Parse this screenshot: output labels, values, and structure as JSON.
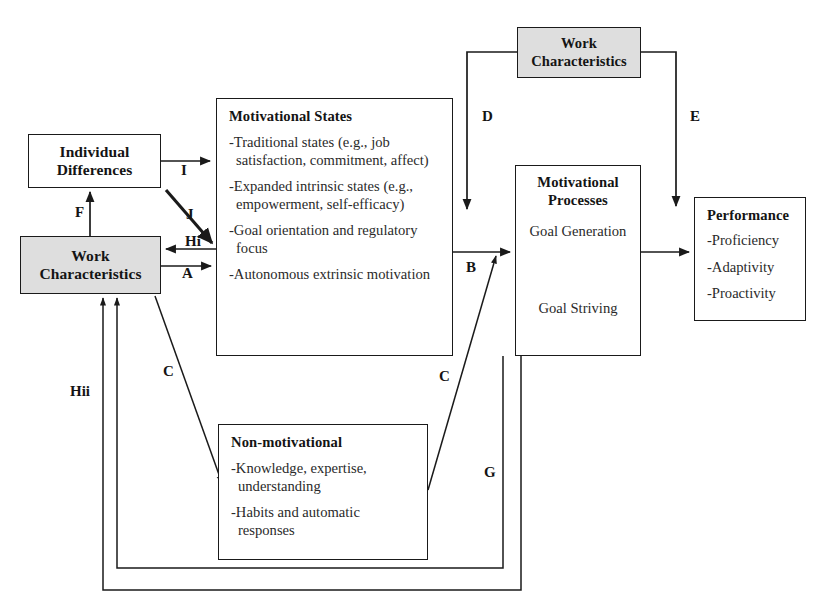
{
  "diagram": {
    "nodes": {
      "individual_differences": {
        "title": "Individual\nDifferences"
      },
      "work_characteristics_left": {
        "title": "Work\nCharacteristics"
      },
      "work_characteristics_top": {
        "title": "Work\nCharacteristics"
      },
      "motivational_states": {
        "title": "Motivational States",
        "items": [
          "-Traditional states (e.g., job satisfaction, commitment, affect)",
          "-Expanded intrinsic states (e.g., empowerment, self-efficacy)",
          "-Goal orientation and regulatory focus",
          "-Autonomous extrinsic motivation"
        ]
      },
      "motivational_processes": {
        "title": "Motivational\nProcesses",
        "goal_generation": "Goal Generation",
        "goal_striving": "Goal Striving"
      },
      "performance": {
        "title": "Performance",
        "items": [
          "-Proficiency",
          "-Adaptivity",
          "-Proactivity"
        ]
      },
      "non_motivational": {
        "title": "Non-motivational",
        "items": [
          "-Knowledge, expertise, understanding",
          "-Habits and automatic responses"
        ]
      }
    },
    "edge_labels": {
      "I": "I",
      "J": "J",
      "F": "F",
      "Hi": "Hi",
      "A": "A",
      "B": "B",
      "C_left": "C",
      "C_right": "C",
      "D": "D",
      "E": "E",
      "G": "G",
      "Hii": "Hii"
    },
    "colors": {
      "stroke": "#1a1a1a",
      "shaded_fill": "#dedede",
      "background": "#ffffff",
      "text": "#2a2a2a"
    }
  }
}
